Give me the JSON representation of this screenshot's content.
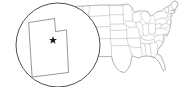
{
  "figure": {
    "name": "us-state-locator-map",
    "width": 183,
    "height": 87,
    "background_color": "#ffffff"
  },
  "basemap": {
    "name": "united-states-states",
    "description": "Contiguous United States with state boundaries",
    "state_fill_color": "#ffffff",
    "state_border_color": "#b9b9b9",
    "nation_outline_color": "#9a9a9a"
  },
  "highlight": {
    "state_name": "Utah",
    "fill_color": "#2b2b2b",
    "stroke_color": "#1a1a1a",
    "center_x": 83,
    "center_y": 33
  },
  "inset": {
    "name": "magnified-utah-inset",
    "shape": "circle",
    "center_x": 58,
    "center_y": 45,
    "radius": 42,
    "fill_color": "#ffffff",
    "stroke_color": "#3a3a3a",
    "state_outline_color": "#6a6a6a"
  },
  "capital_marker": {
    "name": "capital-star",
    "symbol": "star",
    "color": "#1c1c1c",
    "x": 53,
    "y": 40
  },
  "leader_lines": {
    "name": "inset-connector-lines",
    "color": "#2f2f2f",
    "count": 2
  },
  "labels": {
    "visible_text": ""
  }
}
